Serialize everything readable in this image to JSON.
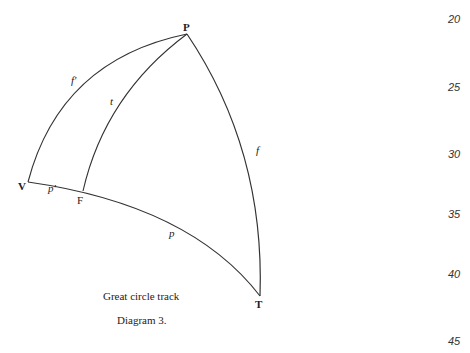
{
  "diagram": {
    "points": {
      "P": {
        "label": "P",
        "x": 187,
        "y": 34
      },
      "V": {
        "label": "V",
        "x": 28,
        "y": 182
      },
      "F": {
        "label": "F",
        "x": 83,
        "y": 191
      },
      "T": {
        "label": "T",
        "x": 260,
        "y": 296
      }
    },
    "arc_labels": {
      "f_prime": "f'",
      "t": "t",
      "f": "f",
      "p_prime": "p'",
      "p": "p"
    },
    "caption": {
      "title": "Great circle track",
      "figure": "Diagram 3."
    },
    "line_numbers": [
      "20",
      "25",
      "30",
      "35",
      "40",
      "45"
    ],
    "stroke_color": "#333333"
  }
}
